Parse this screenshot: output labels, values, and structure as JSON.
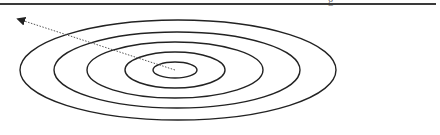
{
  "diagram": {
    "type": "concentric-ellipses",
    "center_label": "OHM",
    "rings": [
      {
        "number": "1",
        "label_x": 199,
        "label_y": 64
      },
      {
        "number": "2",
        "label_x": 230,
        "label_y": 64
      },
      {
        "number": "3",
        "label_x": 267,
        "label_y": 64
      },
      {
        "number": "4",
        "label_x": 304,
        "label_y": 64
      },
      {
        "number": "5",
        "label_x": 338,
        "label_y": 66
      }
    ],
    "flows": [
      {
        "name": "Hap",
        "description": "(rooting in)",
        "direction": "inward",
        "arrow_style": "open-chevron"
      },
      {
        "name": "Gae",
        "description": "(reaching out)",
        "direction": "outward",
        "arrow_style": "solid-triangle"
      }
    ],
    "colors": {
      "ellipse_stroke": "#222222",
      "dotted_line": "#555555",
      "text": "#555555",
      "rule": "#3a3a3a"
    }
  }
}
